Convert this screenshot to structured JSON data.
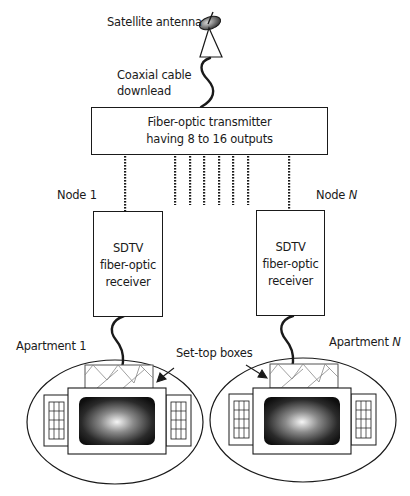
{
  "diagram": {
    "antenna": {
      "label": "Satellite antenna"
    },
    "cable": {
      "label_line1": "Coaxial cable",
      "label_line2": "downlead"
    },
    "transmitter": {
      "line1": "Fiber-optic transmitter",
      "line2": "having 8 to 16 outputs"
    },
    "fiber_outputs_count_shown": 8,
    "nodes": [
      {
        "label": "Node 1",
        "label_prefix": "Node ",
        "label_suffix": "1",
        "receiver_line1": "SDTV",
        "receiver_line2": "fiber-optic",
        "receiver_line3": "receiver"
      },
      {
        "label": "Node N",
        "label_prefix": "Node ",
        "label_suffix": "N",
        "receiver_line1": "SDTV",
        "receiver_line2": "fiber-optic",
        "receiver_line3": "receiver"
      }
    ],
    "apartments": [
      {
        "label_prefix": "Apartment ",
        "label_suffix": "1"
      },
      {
        "label_prefix": "Apartment ",
        "label_suffix": "N"
      }
    ],
    "set_top_label": "Set-top boxes",
    "colors": {
      "stroke": "#1a1a1a",
      "hatch": "#777777",
      "screen_dark": "#141414",
      "screen_light": "#f4f4f4"
    }
  }
}
